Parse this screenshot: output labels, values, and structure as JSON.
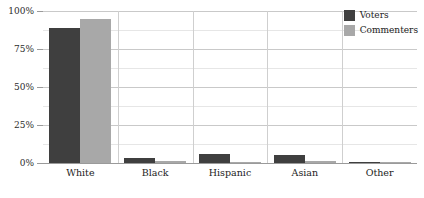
{
  "chart_data": {
    "type": "bar",
    "title": "",
    "subtitle": "",
    "xlabel": "",
    "ylabel": "",
    "categories": [
      "White",
      "Black",
      "Hispanic",
      "Asian",
      "Other"
    ],
    "series": [
      {
        "name": "Voters",
        "color": "#3f3f3f",
        "values": [
          89,
          3,
          6,
          5,
          0.3
        ]
      },
      {
        "name": "Commenters",
        "color": "#a8a8a8",
        "values": [
          95,
          1.5,
          0.7,
          1.5,
          0.2
        ]
      }
    ],
    "ylim": [
      0,
      100
    ],
    "ytick_values": [
      0,
      25,
      50,
      75,
      100
    ],
    "ytick_labels": [
      "0%",
      "25%",
      "50%",
      "75%",
      "100%"
    ],
    "yminor_values": [
      12.5,
      37.5,
      62.5,
      87.5
    ],
    "grid": true,
    "legend_position": "top-right",
    "legend_entries": [
      {
        "label": "Voters",
        "color": "#3f3f3f"
      },
      {
        "label": "Commenters",
        "color": "#a8a8a8"
      }
    ]
  },
  "colors": {
    "voters": "#3f3f3f",
    "commenters": "#a8a8a8",
    "gridline_major": "#c9c9c9",
    "gridline_minor": "#e6e6e6",
    "axis": "#9a9a9a",
    "background": "#ffffff",
    "text": "#1d1d1d"
  }
}
